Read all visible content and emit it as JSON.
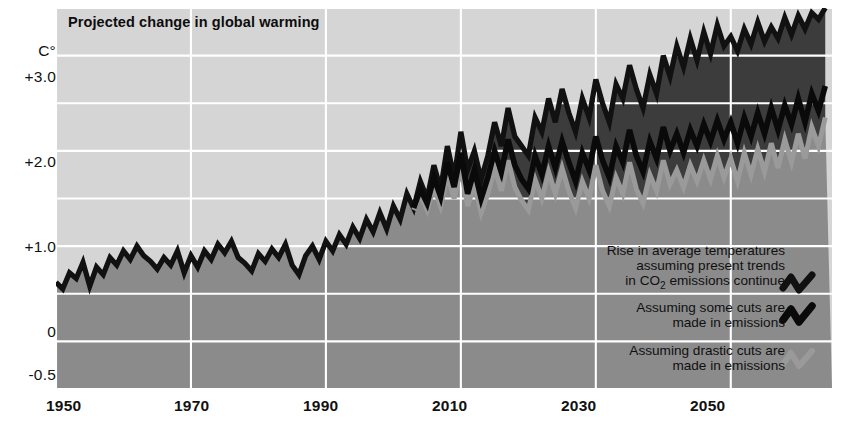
{
  "chart_data": {
    "type": "line",
    "title": "Projected change in global warming",
    "xlabel": "",
    "ylabel": "C°",
    "ylabel_unit": "C°",
    "xlim": [
      1950,
      2065
    ],
    "ylim": [
      -0.5,
      3.5
    ],
    "grid": true,
    "gridlines_y": [
      -0.5,
      0,
      0.5,
      1.0,
      1.5,
      2.0,
      2.5,
      3.0,
      3.5
    ],
    "gridlines_x": [
      1950,
      1970,
      1990,
      2010,
      2030,
      2050
    ],
    "ytick_labels": [
      "+3.0",
      "+2.0",
      "+1.0",
      "0",
      "-0.5"
    ],
    "ytick_values": [
      3.0,
      2.0,
      1.0,
      0,
      -0.5
    ],
    "xtick_labels": [
      "1950",
      "1970",
      "1990",
      "2010",
      "2030",
      "2050"
    ],
    "xtick_values": [
      1950,
      1970,
      1990,
      2010,
      2030,
      2050
    ],
    "legend_position": "inside-bottom-right",
    "colors": {
      "background": "#ffffff",
      "plot_band_light": "#d5d5d5",
      "plot_band_mid": "#8b8b8b",
      "plot_band_dark": "#3c3c3c",
      "grid": "#ffffff",
      "series_high": "#111111",
      "series_mid": "#0a0a0a",
      "series_low": "#9a9a9a",
      "text": "#111111"
    },
    "series": [
      {
        "name": "Rise in average temperatures assuming present trends in CO2 emissions continue",
        "legend_label_lines": [
          "Rise in average temperatures",
          "assuming present trends",
          "in CO₂ emissions continue"
        ],
        "color": "#111111",
        "x": [
          1950,
          1951,
          1952,
          1953,
          1954,
          1955,
          1956,
          1957,
          1958,
          1959,
          1960,
          1961,
          1962,
          1963,
          1964,
          1965,
          1966,
          1967,
          1968,
          1969,
          1970,
          1971,
          1972,
          1973,
          1974,
          1975,
          1976,
          1977,
          1978,
          1979,
          1980,
          1981,
          1982,
          1983,
          1984,
          1985,
          1986,
          1987,
          1988,
          1989,
          1990,
          1991,
          1992,
          1993,
          1994,
          1995,
          1996,
          1997,
          1998,
          1999,
          2000,
          2001,
          2002,
          2003,
          2004,
          2005,
          2006,
          2007,
          2008,
          2009,
          2010,
          2011,
          2012,
          2013,
          2014,
          2015,
          2016,
          2017,
          2018,
          2019,
          2020,
          2021,
          2022,
          2023,
          2024,
          2025,
          2026,
          2027,
          2028,
          2029,
          2030,
          2031,
          2032,
          2033,
          2034,
          2035,
          2036,
          2037,
          2038,
          2039,
          2040,
          2041,
          2042,
          2043,
          2044,
          2045,
          2046,
          2047,
          2048,
          2049,
          2050,
          2051,
          2052,
          2053,
          2054,
          2055,
          2056,
          2057,
          2058,
          2059,
          2060,
          2061,
          2062,
          2063,
          2064
        ],
        "y": [
          0.62,
          0.55,
          0.72,
          0.66,
          0.83,
          0.58,
          0.78,
          0.7,
          0.88,
          0.8,
          0.95,
          0.86,
          1.0,
          0.9,
          0.84,
          0.76,
          0.88,
          0.8,
          0.95,
          0.72,
          0.9,
          0.78,
          0.95,
          0.86,
          1.02,
          0.93,
          1.05,
          0.88,
          0.82,
          0.74,
          0.92,
          0.84,
          0.97,
          0.88,
          1.02,
          0.8,
          0.7,
          0.9,
          1.0,
          0.86,
          1.05,
          0.95,
          1.12,
          1.02,
          1.2,
          1.08,
          1.28,
          1.15,
          1.35,
          1.18,
          1.42,
          1.28,
          1.55,
          1.4,
          1.68,
          1.5,
          1.85,
          1.6,
          2.05,
          1.72,
          2.2,
          1.8,
          2.0,
          1.7,
          1.95,
          2.3,
          2.05,
          2.45,
          2.15,
          2.05,
          1.95,
          2.35,
          2.2,
          2.55,
          2.3,
          2.65,
          2.4,
          2.2,
          2.55,
          2.35,
          2.75,
          2.5,
          2.3,
          2.7,
          2.55,
          2.9,
          2.65,
          2.45,
          2.8,
          2.6,
          3.0,
          2.78,
          3.1,
          2.88,
          3.18,
          2.95,
          3.25,
          3.02,
          3.32,
          3.1,
          3.2,
          3.05,
          3.28,
          3.12,
          3.35,
          3.15,
          3.3,
          3.18,
          3.4,
          3.22,
          3.42,
          3.28,
          3.45,
          3.38,
          3.5
        ]
      },
      {
        "name": "Assuming some cuts are made in emissions",
        "legend_label_lines": [
          "Assuming some cuts are",
          "made in emissions"
        ],
        "color": "#0a0a0a",
        "x": [
          2003,
          2004,
          2005,
          2006,
          2007,
          2008,
          2009,
          2010,
          2011,
          2012,
          2013,
          2014,
          2015,
          2016,
          2017,
          2018,
          2019,
          2020,
          2021,
          2022,
          2023,
          2024,
          2025,
          2026,
          2027,
          2028,
          2029,
          2030,
          2031,
          2032,
          2033,
          2034,
          2035,
          2036,
          2037,
          2038,
          2039,
          2040,
          2041,
          2042,
          2043,
          2044,
          2045,
          2046,
          2047,
          2048,
          2049,
          2050,
          2051,
          2052,
          2053,
          2054,
          2055,
          2056,
          2057,
          2058,
          2059,
          2060,
          2061,
          2062,
          2063,
          2064
        ],
        "y": [
          1.4,
          1.6,
          1.45,
          1.72,
          1.52,
          1.88,
          1.62,
          1.98,
          1.55,
          1.8,
          1.5,
          1.72,
          2.0,
          1.78,
          2.12,
          1.85,
          1.7,
          1.6,
          1.95,
          1.75,
          2.05,
          1.82,
          2.1,
          1.88,
          1.68,
          1.98,
          1.8,
          2.15,
          1.9,
          1.72,
          2.05,
          1.88,
          2.22,
          1.95,
          1.78,
          2.1,
          1.92,
          2.25,
          2.0,
          2.18,
          1.98,
          2.22,
          2.05,
          2.28,
          2.1,
          2.32,
          2.12,
          2.3,
          2.08,
          2.35,
          2.15,
          2.4,
          2.18,
          2.45,
          2.22,
          2.48,
          2.28,
          2.55,
          2.3,
          2.6,
          2.42,
          2.68
        ]
      },
      {
        "name": "Assuming drastic cuts are made in emissions",
        "legend_label_lines": [
          "Assuming drastic cuts are",
          "made in emissions"
        ],
        "color": "#9a9a9a",
        "x": [
          2003,
          2004,
          2005,
          2006,
          2007,
          2008,
          2009,
          2010,
          2011,
          2012,
          2013,
          2014,
          2015,
          2016,
          2017,
          2018,
          2019,
          2020,
          2021,
          2022,
          2023,
          2024,
          2025,
          2026,
          2027,
          2028,
          2029,
          2030,
          2031,
          2032,
          2033,
          2034,
          2035,
          2036,
          2037,
          2038,
          2039,
          2040,
          2041,
          2042,
          2043,
          2044,
          2045,
          2046,
          2047,
          2048,
          2049,
          2050,
          2051,
          2052,
          2053,
          2054,
          2055,
          2056,
          2057,
          2058,
          2059,
          2060,
          2061,
          2062,
          2063,
          2064
        ],
        "y": [
          1.38,
          1.55,
          1.38,
          1.62,
          1.42,
          1.75,
          1.5,
          1.82,
          1.42,
          1.65,
          1.35,
          1.55,
          1.82,
          1.58,
          1.9,
          1.62,
          1.48,
          1.38,
          1.7,
          1.5,
          1.78,
          1.55,
          1.82,
          1.58,
          1.4,
          1.68,
          1.5,
          1.85,
          1.58,
          1.42,
          1.72,
          1.55,
          1.88,
          1.6,
          1.45,
          1.75,
          1.58,
          1.9,
          1.65,
          1.8,
          1.62,
          1.85,
          1.68,
          1.9,
          1.7,
          1.95,
          1.72,
          1.92,
          1.68,
          1.98,
          1.75,
          2.02,
          1.78,
          2.08,
          1.82,
          2.12,
          1.88,
          2.18,
          1.92,
          2.25,
          2.05,
          2.35
        ]
      }
    ]
  },
  "legend": {
    "entries": [
      {
        "id": "legend-1",
        "lines": [
          "Rise in average temperatures",
          "assuming present trends",
          "in CO2 emissions continue"
        ],
        "icon": "zigzag-line-icon",
        "color": "#111111"
      },
      {
        "id": "legend-2",
        "lines": [
          "Assuming some cuts are",
          "made in emissions"
        ],
        "icon": "zigzag-line-icon",
        "color": "#0a0a0a"
      },
      {
        "id": "legend-3",
        "lines": [
          "Assuming drastic cuts are",
          "made in emissions"
        ],
        "icon": "zigzag-line-icon",
        "color": "#9a9a9a"
      }
    ]
  },
  "legend_text": {
    "e1l1": "Rise in average temperatures",
    "e1l2": "assuming present trends",
    "e1l3a": "in CO",
    "e1l3b": "2",
    "e1l3c": " emissions continue",
    "e2l1": "Assuming some cuts are",
    "e2l2": "made in emissions",
    "e3l1": "Assuming drastic cuts are",
    "e3l2": "made in emissions"
  },
  "axes": {
    "y_unit": "C°",
    "y_ticks": [
      "+3.0",
      "+2.0",
      "+1.0",
      "0",
      "-0.5"
    ],
    "x_ticks": [
      "1950",
      "1970",
      "1990",
      "2010",
      "2030",
      "2050"
    ]
  }
}
